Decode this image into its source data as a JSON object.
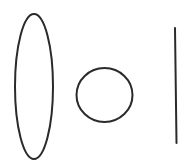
{
  "canvas": {
    "width": 190,
    "height": 168,
    "background": "#ffffff"
  },
  "stroke": {
    "color": "#2a2a2a",
    "width": 2
  },
  "shapes": [
    {
      "type": "ellipse",
      "name": "tall-ellipse",
      "cx": 34,
      "cy": 86.5,
      "rx": 19,
      "ry": 72.5
    },
    {
      "type": "circle",
      "name": "circle",
      "cx": 104.5,
      "cy": 95,
      "rx": 28,
      "ry": 27
    },
    {
      "type": "line",
      "name": "vertical-line",
      "x1": 175,
      "y1": 28,
      "x2": 176.5,
      "y2": 143
    }
  ]
}
